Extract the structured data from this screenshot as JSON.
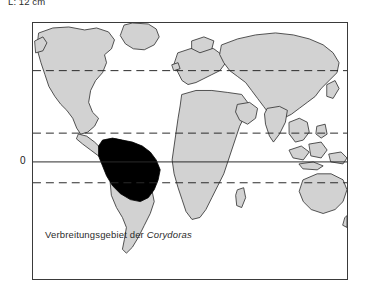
{
  "figure": {
    "size_caption": "L: 12 cm",
    "legend_caption_prefix": "Verbreitungsgebiet der ",
    "legend_caption_species": "Corydoras",
    "equator_label": "0"
  },
  "map": {
    "projection": "equirectangular world map",
    "colors": {
      "land_fill": "#d2d2d2",
      "land_outline": "#2a2a2a",
      "range_fill": "#000000",
      "ocean_fill": "#ffffff",
      "frame_border": "#3a3a3a",
      "graticule_dashed": "#2a2a2a",
      "equator_solid": "#2a2a2a"
    },
    "graticule": {
      "equator": {
        "label": "0",
        "style": "solid",
        "y_px": 162
      },
      "dashed_lines": [
        {
          "name": "tropic-of-cancer-upper",
          "y_px": 70
        },
        {
          "name": "tropic-of-cancer",
          "y_px": 133
        },
        {
          "name": "tropic-of-capricorn",
          "y_px": 183
        }
      ]
    },
    "highlight": {
      "name": "corydoras-distribution-area",
      "region": "northern and central South America",
      "fill": "#000000"
    }
  }
}
